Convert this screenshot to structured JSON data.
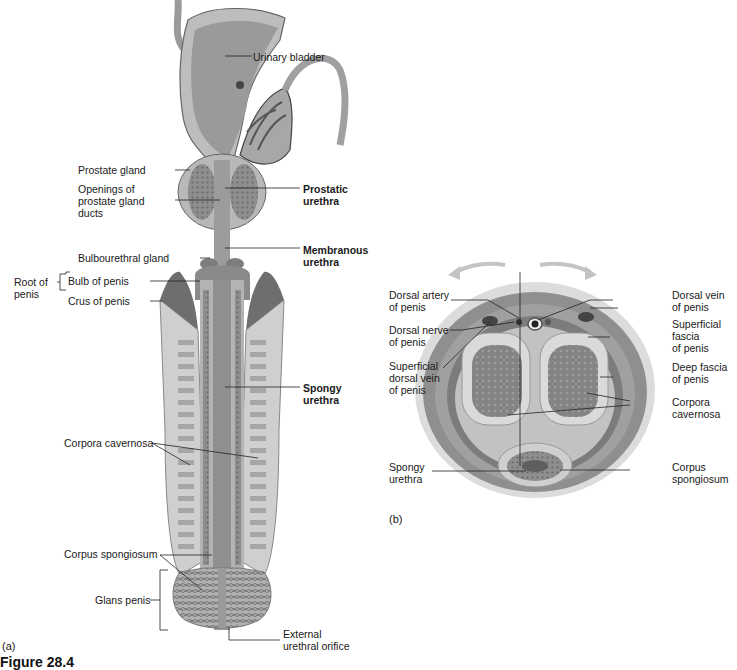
{
  "figure": {
    "caption": "Figure 28.4",
    "panel_a_label": "(a)",
    "panel_b_label": "(b)",
    "colors": {
      "tissue_dark": "#7a7a7a",
      "tissue_mid": "#a8a8a8",
      "tissue_light": "#d4d4d4",
      "spongy": "#8c8c8c",
      "outline": "#555555",
      "leader": "#222222"
    }
  },
  "panel_a": {
    "labels": {
      "urinary_bladder": "Urinary bladder",
      "prostate_gland": "Prostate gland",
      "openings_prostate_ducts": "Openings of\nprostate gland\nducts",
      "prostatic_urethra": "Prostatic\nurethra",
      "bulbourethral_gland": "Bulbourethral gland",
      "membranous_urethra": "Membranous\nurethra",
      "root_of_penis": "Root of\npenis",
      "bulb_of_penis": "Bulb of penis",
      "crus_of_penis": "Crus of penis",
      "spongy_urethra": "Spongy\nurethra",
      "corpora_cavernosa": "Corpora cavernosa",
      "corpus_spongiosum": "Corpus spongiosum",
      "glans_penis": "Glans penis",
      "external_urethral_orifice": "External\nurethral orifice"
    }
  },
  "panel_b": {
    "labels": {
      "dorsal_artery": "Dorsal artery\nof penis",
      "dorsal_nerve": "Dorsal nerve\nof penis",
      "superficial_dorsal_vein": "Superficial\ndorsal vein\nof penis",
      "spongy_urethra": "Spongy\nurethra",
      "dorsal_vein": "Dorsal vein\nof penis",
      "superficial_fascia": "Superficial\nfascia\nof penis",
      "deep_fascia": "Deep fascia\nof penis",
      "corpora_cavernosa": "Corpora\ncavernosa",
      "corpus_spongiosum": "Corpus\nspongiosum"
    }
  }
}
